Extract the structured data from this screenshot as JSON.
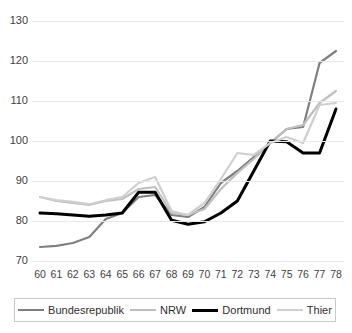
{
  "chart_data": {
    "type": "line",
    "title": "",
    "xlabel": "",
    "ylabel": "",
    "ylim": [
      70,
      130
    ],
    "ytick_labels": [
      "130",
      "120",
      "110",
      "100",
      "90",
      "80",
      "70"
    ],
    "yticks": [
      130,
      120,
      110,
      100,
      90,
      80,
      70
    ],
    "grid": true,
    "legend_position": "bottom",
    "categories": [
      "60",
      "61",
      "62",
      "63",
      "64",
      "65",
      "66",
      "67",
      "68",
      "69",
      "70",
      "71",
      "72",
      "73",
      "74",
      "75",
      "76",
      "77",
      "78"
    ],
    "series": [
      {
        "name": "Bundesrepublik",
        "color": "#7f7f7f",
        "width": 2.2,
        "values": [
          73.5,
          73.8,
          74.5,
          76.0,
          80.5,
          82.0,
          86.0,
          86.5,
          81.5,
          81.0,
          83.5,
          89.5,
          92.5,
          96.0,
          99.5,
          103.0,
          103.5,
          119.5,
          122.5
        ]
      },
      {
        "name": "NRW",
        "color": "#bfbfbf",
        "width": 2.2,
        "values": [
          86.0,
          85.0,
          84.5,
          84.0,
          85.0,
          85.5,
          88.0,
          88.5,
          82.0,
          81.5,
          83.0,
          88.0,
          92.0,
          95.5,
          99.5,
          103.0,
          104.0,
          109.5,
          112.5
        ]
      },
      {
        "name": "Dortmund",
        "color": "#000000",
        "width": 3.0,
        "values": [
          82.0,
          81.8,
          81.5,
          81.2,
          81.5,
          82.0,
          87.2,
          87.2,
          80.2,
          79.2,
          79.8,
          82.0,
          85.0,
          92.5,
          100.0,
          99.8,
          97.0,
          97.0,
          108.0
        ]
      },
      {
        "name": "Thier",
        "color": "#cfcfcf",
        "width": 2.2,
        "values": [
          86.0,
          85.2,
          84.8,
          84.2,
          85.2,
          86.0,
          89.5,
          91.0,
          82.5,
          81.5,
          84.5,
          90.5,
          97.0,
          96.5,
          99.5,
          101.0,
          99.5,
          109.0,
          109.5
        ]
      }
    ]
  },
  "legend": {
    "items": [
      {
        "label": "Bundesrepublik",
        "color": "#7f7f7f",
        "width": 2
      },
      {
        "label": "NRW",
        "color": "#bfbfbf",
        "width": 2
      },
      {
        "label": "Dortmund",
        "color": "#000000",
        "width": 3
      },
      {
        "label": "Thier",
        "color": "#cfcfcf",
        "width": 2
      }
    ]
  }
}
